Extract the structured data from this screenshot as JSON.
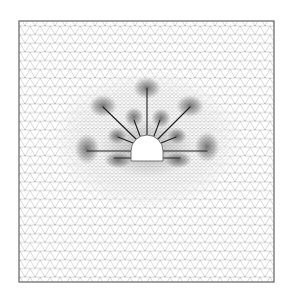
{
  "figure": {
    "type": "finite-element-mesh",
    "colors": {
      "background": "#ffffff",
      "frame": "#6e6e6e",
      "mesh": "#b4b4b4",
      "dense_mesh": "#9a9a9a",
      "bolt": "#1e1e1e",
      "tunnel": "#ffffff",
      "tunnel_outline": "#555555",
      "shading": "#404040"
    },
    "frame": {
      "x": 19,
      "y": 21,
      "width": 255,
      "height": 261
    },
    "tunnel": {
      "shape": "horseshoe",
      "left": 131,
      "right": 163,
      "floor_y": 161,
      "springline_y": 151,
      "crown_y": 135
    },
    "bolts": [
      {
        "id": "long-left",
        "x1": 131,
        "y1": 151,
        "x2": 87,
        "y2": 151
      },
      {
        "id": "long-right",
        "x1": 163,
        "y1": 151,
        "x2": 207,
        "y2": 151
      },
      {
        "id": "long-crown",
        "x1": 147,
        "y1": 135,
        "x2": 147,
        "y2": 88
      },
      {
        "id": "long-diag-left",
        "x1": 137,
        "y1": 140,
        "x2": 103,
        "y2": 107
      },
      {
        "id": "long-diag-right",
        "x1": 157,
        "y1": 140,
        "x2": 190,
        "y2": 107
      },
      {
        "id": "short-upper-left",
        "x1": 140,
        "y1": 136,
        "x2": 134,
        "y2": 120
      },
      {
        "id": "short-upper-right",
        "x1": 154,
        "y1": 136,
        "x2": 160,
        "y2": 120
      },
      {
        "id": "short-mid-left",
        "x1": 133,
        "y1": 143,
        "x2": 118,
        "y2": 137
      },
      {
        "id": "short-mid-right",
        "x1": 161,
        "y1": 143,
        "x2": 176,
        "y2": 137
      },
      {
        "id": "short-floor-left",
        "x1": 131,
        "y1": 158,
        "x2": 114,
        "y2": 158
      },
      {
        "id": "short-floor-right",
        "x1": 163,
        "y1": 158,
        "x2": 180,
        "y2": 158
      }
    ],
    "shading_zones": [
      {
        "cx": 147,
        "cy": 88,
        "rx": 10,
        "ry": 8
      },
      {
        "cx": 103,
        "cy": 106,
        "rx": 10,
        "ry": 8
      },
      {
        "cx": 190,
        "cy": 106,
        "rx": 10,
        "ry": 8
      },
      {
        "cx": 87,
        "cy": 149,
        "rx": 9,
        "ry": 11
      },
      {
        "cx": 207,
        "cy": 147,
        "rx": 9,
        "ry": 11
      },
      {
        "cx": 134,
        "cy": 117,
        "rx": 7,
        "ry": 7
      },
      {
        "cx": 161,
        "cy": 118,
        "rx": 7,
        "ry": 7
      },
      {
        "cx": 117,
        "cy": 136,
        "rx": 7,
        "ry": 6
      },
      {
        "cx": 177,
        "cy": 136,
        "rx": 7,
        "ry": 6
      },
      {
        "cx": 118,
        "cy": 160,
        "rx": 10,
        "ry": 6
      },
      {
        "cx": 178,
        "cy": 160,
        "rx": 10,
        "ry": 6
      }
    ],
    "dense_zone": {
      "cx": 147,
      "cy": 140,
      "rx": 95,
      "ry": 70
    }
  }
}
